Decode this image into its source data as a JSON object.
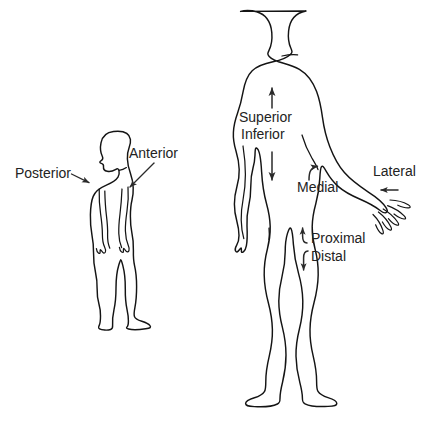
{
  "diagram": {
    "background_color": "#ffffff",
    "line_color": "#141414",
    "text_color": "#232323",
    "figures": [
      {
        "name": "lateral-view-figure",
        "orientation": "side profile, facing right",
        "description": "Standing human body seen from the side"
      },
      {
        "name": "anterior-view-figure",
        "orientation": "front facing",
        "description": "Standing human body seen from the front with right arm extended"
      }
    ],
    "labels": {
      "posterior": "Posterior",
      "anterior": "Anterior",
      "superior": "Superior",
      "inferior": "Inferior",
      "medial": "Medial",
      "lateral": "Lateral",
      "proximal": "Proximal",
      "distal": "Distal"
    }
  }
}
